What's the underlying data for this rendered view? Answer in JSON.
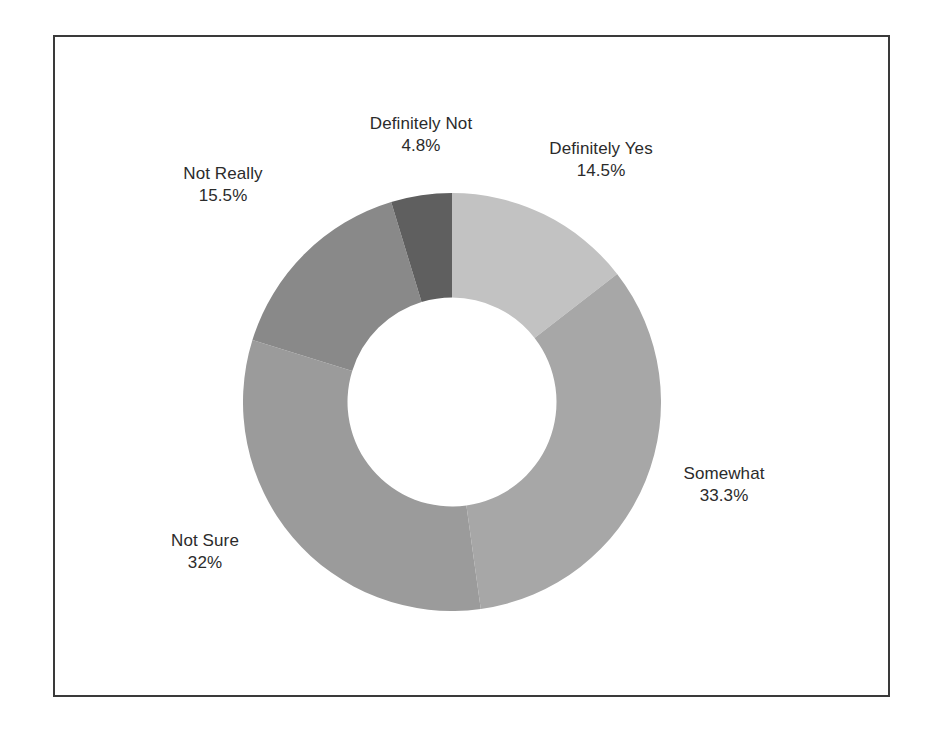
{
  "chart_data": {
    "type": "pie",
    "variant": "donut",
    "title": "",
    "subtitle": "",
    "xlabel": "",
    "ylabel": "",
    "grid": false,
    "legend": "none",
    "labels_position": "outside",
    "start_angle_deg": 0,
    "direction": "clockwise",
    "hole_ratio": 0.5,
    "categories": [
      "Definitely Yes",
      "Somewhat",
      "Not Sure",
      "Not Really",
      "Definitely Not"
    ],
    "values": [
      14.5,
      33.3,
      32,
      15.5,
      4.8
    ],
    "value_labels": [
      "14.5%",
      "33.3%",
      "32%",
      "15.5%",
      "4.8%"
    ],
    "colors": [
      "#c2c2c2",
      "#a7a7a7",
      "#9b9b9b",
      "#898989",
      "#5f5f5f"
    ],
    "slices": [
      {
        "name": "Definitely Yes",
        "value": 14.5,
        "value_label": "14.5%",
        "color": "#c2c2c2",
        "start_angle": 0,
        "end_angle": 52.2
      },
      {
        "name": "Somewhat",
        "value": 33.3,
        "value_label": "33.3%",
        "color": "#a7a7a7",
        "start_angle": 52.2,
        "end_angle": 172.08
      },
      {
        "name": "Not Sure",
        "value": 32,
        "value_label": "32%",
        "color": "#9b9b9b",
        "start_angle": 172.08,
        "end_angle": 287.28
      },
      {
        "name": "Not Really",
        "value": 15.5,
        "value_label": "15.5%",
        "color": "#898989",
        "start_angle": 287.28,
        "end_angle": 343.08
      },
      {
        "name": "Definitely Not",
        "value": 4.8,
        "value_label": "4.8%",
        "color": "#5f5f5f",
        "start_angle": 343.08,
        "end_angle": 360
      }
    ]
  },
  "frame": {
    "border_color": "#3a3a3a",
    "background_color": "#ffffff"
  }
}
